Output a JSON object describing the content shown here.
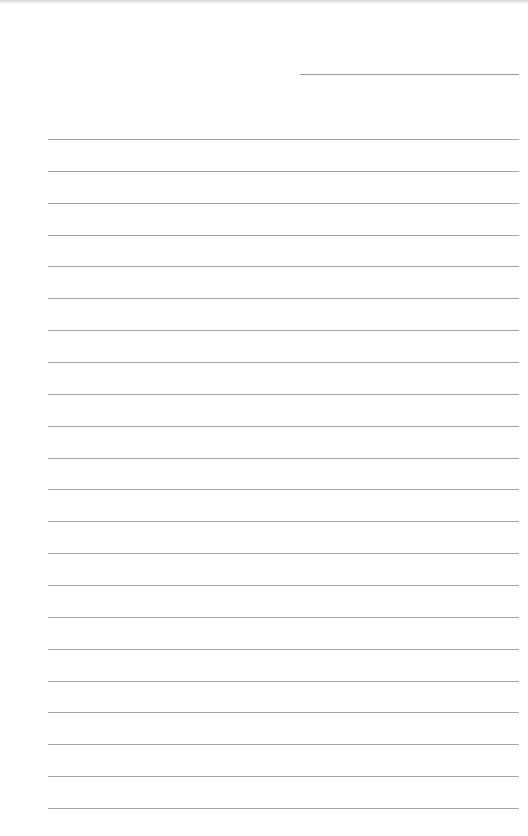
{
  "page": {
    "type": "lined-paper",
    "background_color": "#ffffff",
    "line_color": "#a4a4a4",
    "date_line": {
      "left": 300,
      "top": 74,
      "width": 219
    },
    "ruled_lines": {
      "count": 22,
      "left": 48,
      "width": 471,
      "first_top": 139,
      "spacing": 31.86
    }
  }
}
